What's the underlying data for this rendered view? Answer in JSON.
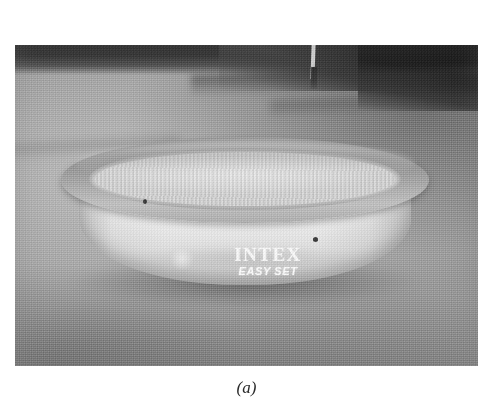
{
  "figure": {
    "caption": "(a)",
    "photo": {
      "subject": "inflatable round above-ground swimming pool on a grass lawn",
      "color_mode": "grayscale",
      "brand_logo": {
        "primary_text": "INTEX",
        "secondary_text": "EASY SET"
      },
      "scene_elements": [
        {
          "name": "treeline-shadow-band",
          "description": "dark horizontal band across the top of the photo"
        },
        {
          "name": "lawn",
          "description": "mown grass covering most of the frame"
        },
        {
          "name": "background-post",
          "description": "light vertical post with dark base in the upper middle"
        },
        {
          "name": "pool-top-ring",
          "description": "inflatable gray ring around the pool rim"
        },
        {
          "name": "pool-water",
          "description": "light gray water surface inside the ring"
        },
        {
          "name": "pool-wall",
          "description": "white vinyl side wall of the pool"
        },
        {
          "name": "wall-spot-left",
          "description": "small dark blemish on the left of the pool wall"
        },
        {
          "name": "wall-spot-right",
          "description": "small dark blemish on the right of the pool wall"
        },
        {
          "name": "ground-shadow",
          "description": "shadow cast under the pool"
        }
      ]
    },
    "palette": {
      "page_background": "#ffffff",
      "treeline_dark": "#1c1c1c",
      "grass_mid": "#a6a6a6",
      "grass_dark": "#8b8b8b",
      "pool_ring": "#9c9c9c",
      "pool_wall_light": "#f1f1f1",
      "water": "#d7d7d7",
      "logo_text": "#ffffff",
      "caption_text": "#2b2b2b"
    }
  }
}
